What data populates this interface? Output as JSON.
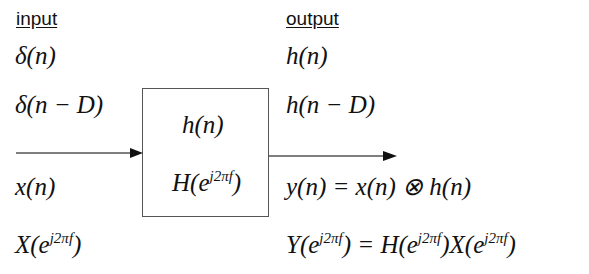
{
  "headers": {
    "input": "input",
    "output": "output"
  },
  "inputs": {
    "impulse": "δ(n)",
    "delayed_impulse": "δ(n − D)",
    "signal": "x(n)",
    "spectrum_base": "X(e",
    "spectrum_exp": "j2πf",
    "spectrum_close": ")"
  },
  "system": {
    "impulse_response": "h(n)",
    "freq_base": "H(e",
    "freq_exp": "j2πf",
    "freq_close": ")"
  },
  "outputs": {
    "impulse_response": "h(n)",
    "delayed_response": "h(n − D)",
    "convolution": "y(n) = x(n) ⊗ h(n)",
    "product": {
      "y_base": "Y(e",
      "y_exp": "j2πf",
      "eq": ") = H(e",
      "h_exp": "j2πf",
      "mid": ")X(e",
      "x_exp": "j2πf",
      "close": ")"
    }
  },
  "colors": {
    "line": "#555555",
    "arrow": "#111111",
    "text": "#111111"
  }
}
